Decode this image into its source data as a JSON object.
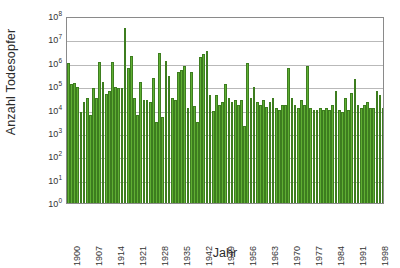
{
  "chart_data": {
    "type": "bar",
    "title": "",
    "xlabel": "Jahr",
    "ylabel": "Anzahl Todesopfer",
    "yscale": "log",
    "ylim": [
      1,
      100000000
    ],
    "grid": true,
    "legend": null,
    "bar_color": "#5faf33",
    "bar_edge_color": "#3d7d1f",
    "frame_color": "#8a8a8a",
    "gridline_color": "#b9b9b9",
    "y_tick_labels": [
      "10⁰",
      "10¹",
      "10²",
      "10³",
      "10⁴",
      "10⁵",
      "10⁶",
      "10⁷",
      "10⁸"
    ],
    "y_tick_values": [
      1,
      10,
      100,
      1000,
      10000,
      100000,
      1000000,
      10000000,
      100000000
    ],
    "x_tick_labels": [
      "1900",
      "1907",
      "1914",
      "1921",
      "1928",
      "1935",
      "1942",
      "1949",
      "1956",
      "1963",
      "1970",
      "1977",
      "1984",
      "1991",
      "1998"
    ],
    "x_tick_values": [
      1900,
      1907,
      1914,
      1921,
      1928,
      1935,
      1942,
      1949,
      1956,
      1963,
      1970,
      1977,
      1984,
      1991,
      1998
    ],
    "categories": [
      1900,
      1901,
      1902,
      1903,
      1904,
      1905,
      1906,
      1907,
      1908,
      1909,
      1910,
      1911,
      1912,
      1913,
      1914,
      1915,
      1916,
      1917,
      1918,
      1919,
      1920,
      1921,
      1922,
      1923,
      1924,
      1925,
      1926,
      1927,
      1928,
      1929,
      1930,
      1931,
      1932,
      1933,
      1934,
      1935,
      1936,
      1937,
      1938,
      1939,
      1940,
      1941,
      1942,
      1943,
      1944,
      1945,
      1946,
      1947,
      1948,
      1949,
      1950,
      1951,
      1952,
      1953,
      1954,
      1955,
      1956,
      1957,
      1958,
      1959,
      1960,
      1961,
      1962,
      1963,
      1964,
      1965,
      1966,
      1967,
      1968,
      1969,
      1970,
      1971,
      1972,
      1973,
      1974,
      1975,
      1976,
      1977,
      1978,
      1979,
      1980,
      1981,
      1982,
      1983,
      1984,
      1985,
      1986,
      1987,
      1988,
      1989,
      1990,
      1991,
      1992,
      1993,
      1994,
      1995,
      1996,
      1997,
      1998,
      1999,
      2000
    ],
    "values": [
      1000000,
      120000,
      140000,
      90000,
      8000,
      20000,
      30000,
      6000,
      80000,
      30000,
      1100000,
      150000,
      45000,
      60000,
      1100000,
      90000,
      80000,
      80000,
      30000000,
      600000,
      2000000,
      30000,
      6000,
      150000,
      25000,
      25000,
      20000,
      220000,
      3000,
      2600000,
      5000,
      1200000,
      260000,
      30000,
      25000,
      400000,
      500000,
      700000,
      12000,
      400000,
      14000,
      3000,
      1700000,
      2400000,
      3200000,
      40000,
      9000,
      40000,
      15000,
      20000,
      120000,
      30000,
      20000,
      25000,
      15000,
      25000,
      2000,
      1000000,
      30000,
      90000,
      20000,
      15000,
      25000,
      13000,
      20000,
      30000,
      12000,
      10000,
      15000,
      15000,
      600000,
      30000,
      15000,
      12000,
      25000,
      15000,
      700000,
      12000,
      10000,
      10000,
      12000,
      10000,
      12000,
      10000,
      15000,
      60000,
      10000,
      8000,
      30000,
      10000,
      50000,
      200000,
      15000,
      12000,
      15000,
      20000,
      12000,
      12000,
      60000,
      40000,
      12000
    ]
  },
  "axes": {
    "y_title": "Anzahl Todesopfer",
    "x_title": "Jahr"
  }
}
